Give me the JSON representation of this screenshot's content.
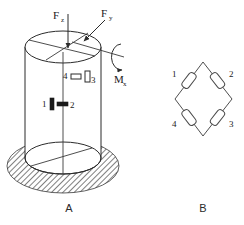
{
  "figure": {
    "panels": [
      {
        "id": "A",
        "label": "A",
        "caption_name": "panel-label-a",
        "description": "Cylindrical load cell with strain gauges and applied loads"
      },
      {
        "id": "B",
        "label": "B",
        "caption_name": "panel-label-b",
        "description": "Wheatstone bridge circuit of the four strain gauges"
      }
    ],
    "loads": [
      {
        "name": "axial-force",
        "symbol": "F",
        "subscript": "z",
        "direction": "downward-vertical"
      },
      {
        "name": "lateral-force",
        "symbol": "F",
        "subscript": "y",
        "direction": "diagonal-down-left"
      },
      {
        "name": "torsion-moment",
        "symbol": "M",
        "subscript": "x",
        "direction": "rotational-arc"
      }
    ],
    "gauges": [
      {
        "id": "1",
        "label": "1",
        "orientation": "vertical",
        "style": "filled",
        "position": "lower-left"
      },
      {
        "id": "2",
        "label": "2",
        "orientation": "horizontal",
        "style": "filled",
        "position": "lower-right"
      },
      {
        "id": "3",
        "label": "3",
        "orientation": "vertical",
        "style": "outline",
        "position": "upper-right"
      },
      {
        "id": "4",
        "label": "4",
        "orientation": "horizontal",
        "style": "outline",
        "position": "upper-left"
      }
    ],
    "bridge": {
      "shape": "diamond",
      "resistors": [
        {
          "id": "1",
          "label": "1",
          "corner": "upper-left"
        },
        {
          "id": "2",
          "label": "2",
          "corner": "upper-right"
        },
        {
          "id": "3",
          "label": "3",
          "corner": "lower-right"
        },
        {
          "id": "4",
          "label": "4",
          "corner": "lower-left"
        }
      ]
    },
    "colors": {
      "ink": "#2b2b2b",
      "ink_dark": "#1a1a1a",
      "background": "#ffffff",
      "hatch": "#3a3a3a"
    }
  }
}
